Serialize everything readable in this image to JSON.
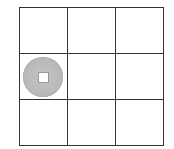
{
  "board": {
    "rows": 3,
    "cols": 3,
    "cells": [
      [
        {
          "piece": null
        },
        {
          "piece": null
        },
        {
          "piece": null
        }
      ],
      [
        {
          "piece": "coin"
        },
        {
          "piece": null
        },
        {
          "piece": null
        }
      ],
      [
        {
          "piece": null
        },
        {
          "piece": null
        },
        {
          "piece": null
        }
      ]
    ],
    "colors": {
      "grid_line": "#333333",
      "cell_bg": "#ffffff",
      "coin_fill": "#bbbbbb",
      "coin_hole": "#ffffff"
    },
    "pieces": [
      {
        "type": "coin",
        "icon": "square-hole-coin-icon",
        "row": 1,
        "col": 0
      }
    ]
  }
}
